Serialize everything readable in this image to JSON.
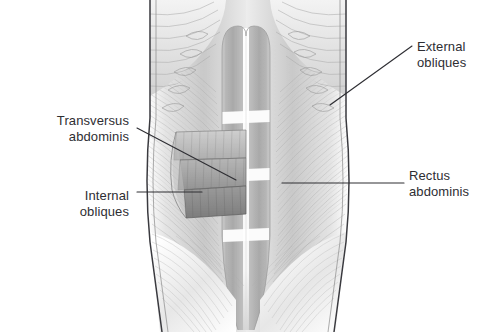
{
  "figure": {
    "view": "anterior",
    "style": "grayscale pencil medical illustration",
    "background_color": "#ffffff",
    "ink_color": "#2e2e33"
  },
  "labels": [
    {
      "id": "external-obliques",
      "line1": "External",
      "line2": "obliques",
      "align": "left",
      "leader": "diagonal down-left to right flank"
    },
    {
      "id": "rectus-abdominis",
      "line1": "Rectus",
      "line2": "abdominis",
      "align": "left",
      "leader": "horizontal left to central muscle column"
    },
    {
      "id": "transversus-abdominis",
      "line1": "Transversus",
      "line2": "abdominis",
      "align": "right",
      "leader": "diagonal down-right to deepest cut flap"
    },
    {
      "id": "internal-obliques",
      "line1": "Internal",
      "line2": "obliques",
      "align": "right",
      "leader": "horizontal right to mid cut flap"
    }
  ],
  "palette": {
    "muscle_light": "#d8d8d8",
    "muscle_mid": "#b4b4b4",
    "muscle_dark": "#8d8d8d",
    "muscle_darkest": "#767676",
    "tendon_white": "#fbfbfb",
    "outline": "#3a3a3f",
    "leader": "#2e2e33"
  }
}
